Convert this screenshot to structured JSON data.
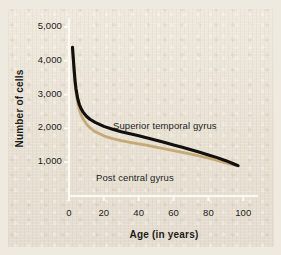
{
  "chart_data": {
    "type": "line",
    "title": "",
    "subtitle": "",
    "xlabel": "Age (in years)",
    "ylabel": "Number of cells",
    "xlim": [
      0,
      105
    ],
    "ylim": [
      0,
      5000
    ],
    "xticks": [
      "0",
      "20",
      "40",
      "60",
      "80",
      "100"
    ],
    "xtick_values": [
      0,
      20,
      40,
      60,
      80,
      100
    ],
    "yticks": [
      "1,000",
      "2,000",
      "3,000",
      "4,000",
      "5,000"
    ],
    "ytick_values": [
      1000,
      2000,
      3000,
      4000,
      5000
    ],
    "grid": false,
    "legend_position": "inline-annotations",
    "annotations": [
      {
        "text": "Superior temporal gyrus",
        "series": "Superior temporal gyrus"
      },
      {
        "text": "Post central gyrus",
        "series": "Post central gyrus"
      }
    ],
    "series": [
      {
        "name": "Superior temporal gyrus",
        "color": "#12100e",
        "x": [
          2,
          2.5,
          3,
          3.5,
          4,
          5,
          6,
          7,
          8,
          10,
          12,
          15,
          20,
          25,
          30,
          35,
          40,
          45,
          50,
          55,
          60,
          65,
          70,
          75,
          80,
          85,
          90,
          95,
          97
        ],
        "y": [
          4400,
          4050,
          3700,
          3400,
          3180,
          2880,
          2700,
          2580,
          2490,
          2360,
          2270,
          2180,
          2060,
          1975,
          1900,
          1840,
          1780,
          1715,
          1650,
          1580,
          1510,
          1440,
          1370,
          1295,
          1215,
          1135,
          1045,
          940,
          900
        ]
      },
      {
        "name": "Post central gyrus",
        "color": "#c5a977",
        "x": [
          2,
          2.5,
          3,
          3.5,
          4,
          5,
          6,
          7,
          8,
          10,
          12,
          15,
          20,
          25,
          30,
          35,
          40,
          45,
          50,
          55,
          60,
          65,
          70,
          75,
          80,
          85,
          90,
          95,
          97
        ],
        "y": [
          4400,
          4000,
          3620,
          3300,
          3060,
          2740,
          2540,
          2400,
          2290,
          2130,
          2020,
          1900,
          1780,
          1700,
          1640,
          1590,
          1545,
          1495,
          1445,
          1395,
          1345,
          1292,
          1238,
          1180,
          1118,
          1052,
          980,
          915,
          890
        ]
      }
    ]
  },
  "axis_style": {
    "axis_line_color": "#fbf9f4",
    "tick_color": "#fbf9f4",
    "background_color": "#e8e1d3"
  }
}
